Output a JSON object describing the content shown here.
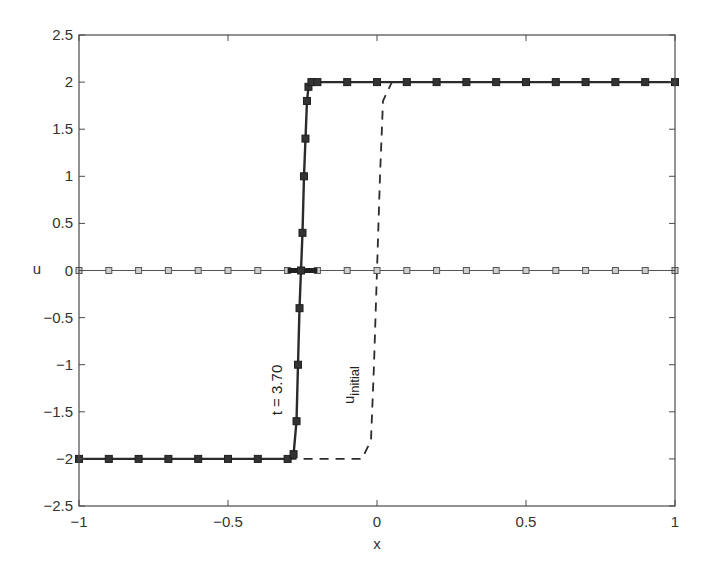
{
  "chart_data": {
    "type": "line",
    "title": "",
    "xlabel": "x",
    "ylabel": "u",
    "xlim": [
      -1,
      1
    ],
    "ylim": [
      -2.5,
      2.5
    ],
    "grid": false,
    "legend": null,
    "x_ticks": [
      -1,
      -0.5,
      0,
      0.5,
      1
    ],
    "x_tick_labels": [
      "-1",
      "-0.5",
      "0",
      "0.5",
      "1"
    ],
    "y_ticks": [
      -2.5,
      -2,
      -1.5,
      -1,
      -0.5,
      0,
      0.5,
      1,
      1.5,
      2,
      2.5
    ],
    "y_tick_labels": [
      "-2.5",
      "-2",
      "-1.5",
      "-1",
      "-0.5",
      "0",
      "0.5",
      "1",
      "1.5",
      "2",
      "2.5"
    ],
    "annotations": [
      {
        "text": "t = 3.70",
        "x": -0.33,
        "y": -1.1,
        "rotation": -90
      },
      {
        "text": "u",
        "subscript": "initial",
        "x": -0.1,
        "y": -1.1,
        "rotation": -90
      }
    ],
    "series": [
      {
        "name": "solution t = 3.70",
        "style": "solid-thick-square-markers",
        "color": "#2b2b2b",
        "x": [
          -1.0,
          -0.9,
          -0.8,
          -0.7,
          -0.6,
          -0.5,
          -0.4,
          -0.3,
          -0.28,
          -0.27,
          -0.265,
          -0.26,
          -0.255,
          -0.25,
          -0.245,
          -0.24,
          -0.235,
          -0.23,
          -0.22,
          -0.2,
          -0.1,
          0.0,
          0.1,
          0.2,
          0.3,
          0.4,
          0.5,
          0.6,
          0.7,
          0.8,
          0.9,
          1.0
        ],
        "y": [
          -2,
          -2,
          -2,
          -2,
          -2,
          -2,
          -2,
          -2,
          -1.95,
          -1.6,
          -1.0,
          -0.4,
          0.0,
          0.4,
          1.0,
          1.4,
          1.8,
          1.95,
          2,
          2,
          2,
          2,
          2,
          2,
          2,
          2,
          2,
          2,
          2,
          2,
          2,
          2
        ]
      },
      {
        "name": "u_initial",
        "style": "dashed",
        "color": "#2b2b2b",
        "x": [
          -0.3,
          -0.05,
          -0.02,
          -0.01,
          0.0,
          0.01,
          0.02,
          0.05,
          1.0
        ],
        "y": [
          -2,
          -2,
          -1.8,
          -1.0,
          0.0,
          1.0,
          1.8,
          2,
          2
        ]
      },
      {
        "name": "u = 0 baseline",
        "style": "thin-open-square-markers",
        "color": "#555555",
        "x": [
          -1.0,
          -0.9,
          -0.8,
          -0.7,
          -0.6,
          -0.5,
          -0.4,
          -0.3,
          -0.2,
          -0.1,
          0.0,
          0.1,
          0.2,
          0.3,
          0.4,
          0.5,
          0.6,
          0.7,
          0.8,
          0.9,
          1.0
        ],
        "y": [
          0,
          0,
          0,
          0,
          0,
          0,
          0,
          0,
          0,
          0,
          0,
          0,
          0,
          0,
          0,
          0,
          0,
          0,
          0,
          0,
          0
        ]
      },
      {
        "name": "shock band near u = 0",
        "style": "thick-bar",
        "color": "#1f1f1f",
        "x": [
          -0.3,
          -0.2
        ],
        "y": [
          0,
          0
        ]
      }
    ],
    "plot_area_px": {
      "left": 79,
      "right": 675,
      "top": 35,
      "bottom": 506
    }
  },
  "labels": {
    "xlabel": "x",
    "ylabel": "u",
    "annot_time": "t = 3.70",
    "annot_initial_main": "u",
    "annot_initial_sub": "initial"
  }
}
